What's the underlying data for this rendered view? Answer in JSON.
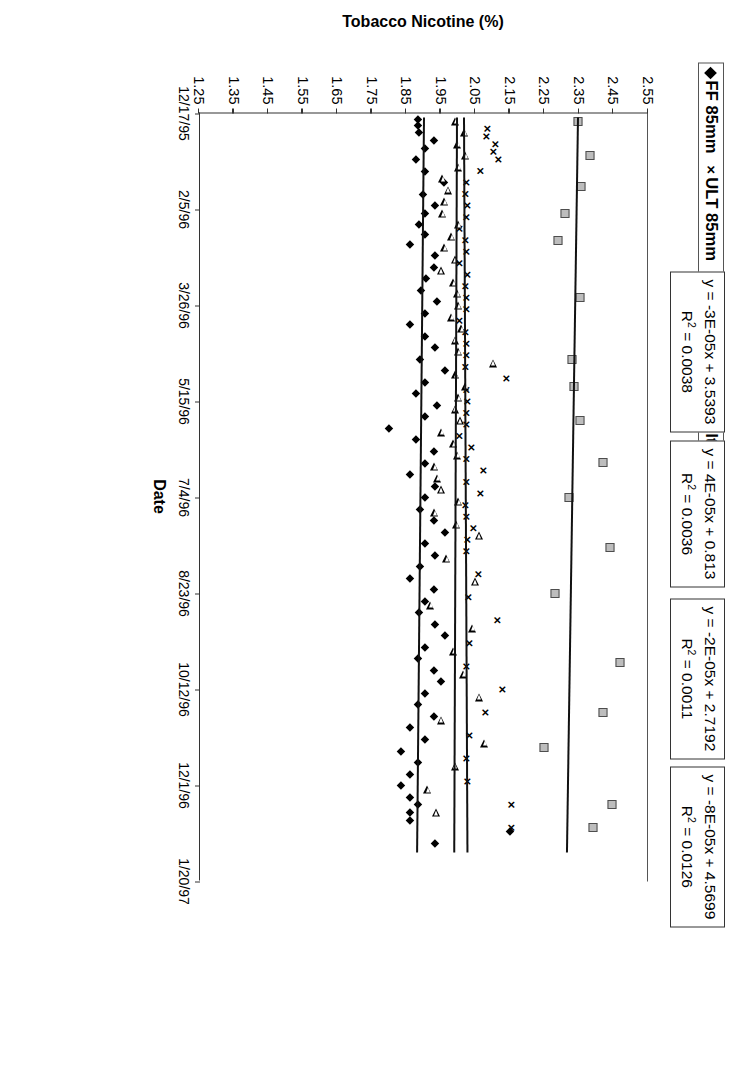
{
  "legend": {
    "items": [
      {
        "glyph": "diamond-marker",
        "label": "FF 85mm"
      },
      {
        "glyph": "x-marker",
        "label": "ULT 85mm"
      },
      {
        "glyph": "triangle-marker",
        "label": "LT 85mm"
      },
      {
        "glyph": "square-marker",
        "label": "Non-Filtered 70mm"
      }
    ]
  },
  "equations": [
    {
      "line1": "y = -3E-05x + 3.5393",
      "r2_label": "R",
      "r2_exp": "2",
      "r2_value": " = 0.0038"
    },
    {
      "line1": "y = 4E-05x + 0.813",
      "r2_label": "R",
      "r2_exp": "2",
      "r2_value": " = 0.0036"
    },
    {
      "line1": "y = -2E-05x + 2.7192",
      "r2_label": "R",
      "r2_exp": "2",
      "r2_value": " = 0.0011"
    },
    {
      "line1": "y = -8E-05x + 4.5699",
      "r2_label": "R",
      "r2_exp": "2",
      "r2_value": " = 0.0126"
    }
  ],
  "chart_data": {
    "type": "scatter",
    "title": "",
    "xlabel": "Date",
    "ylabel": "Tobacco Nicotine (%)",
    "ylim": [
      1.25,
      2.55
    ],
    "yticks": [
      "2.55",
      "2.45",
      "2.35",
      "2.25",
      "2.15",
      "2.05",
      "1.95",
      "1.85",
      "1.75",
      "1.65",
      "1.55",
      "1.45",
      "1.35",
      "1.25"
    ],
    "xticks": [
      "12/17/95",
      "2/5/96",
      "3/26/96",
      "5/15/96",
      "7/4/96",
      "8/23/96",
      "10/12/96",
      "12/1/96",
      "1/20/97"
    ],
    "xlim_days": [
      0,
      400
    ],
    "grid": false,
    "legend_position": "top-left-outside",
    "series": [
      {
        "name": "FF 85mm",
        "marker": "diamond",
        "color": "#000000",
        "trendline": {
          "equation": "y = -2E-05x + 2.7192",
          "r2": 0.0011,
          "y_start": 1.905,
          "y_end": 1.885
        },
        "points": [
          [
            3,
            1.885
          ],
          [
            6,
            1.885
          ],
          [
            10,
            1.888
          ],
          [
            14,
            1.93
          ],
          [
            18,
            1.905
          ],
          [
            24,
            1.88
          ],
          [
            30,
            1.905
          ],
          [
            36,
            1.96
          ],
          [
            42,
            1.9
          ],
          [
            48,
            1.935
          ],
          [
            52,
            1.905
          ],
          [
            58,
            1.888
          ],
          [
            63,
            1.905
          ],
          [
            68,
            1.862
          ],
          [
            74,
            1.935
          ],
          [
            80,
            1.93
          ],
          [
            86,
            1.908
          ],
          [
            92,
            1.892
          ],
          [
            98,
            1.938
          ],
          [
            104,
            1.905
          ],
          [
            110,
            1.862
          ],
          [
            116,
            1.905
          ],
          [
            122,
            1.935
          ],
          [
            128,
            1.89
          ],
          [
            134,
            1.962
          ],
          [
            140,
            1.905
          ],
          [
            146,
            1.88
          ],
          [
            152,
            1.938
          ],
          [
            158,
            1.905
          ],
          [
            164,
            1.8
          ],
          [
            170,
            1.88
          ],
          [
            176,
            1.93
          ],
          [
            182,
            1.905
          ],
          [
            188,
            1.862
          ],
          [
            194,
            1.935
          ],
          [
            200,
            1.905
          ],
          [
            206,
            1.89
          ],
          [
            212,
            1.93
          ],
          [
            218,
            1.962
          ],
          [
            224,
            1.905
          ],
          [
            230,
            1.935
          ],
          [
            236,
            1.89
          ],
          [
            242,
            1.862
          ],
          [
            248,
            1.93
          ],
          [
            254,
            1.905
          ],
          [
            260,
            1.888
          ],
          [
            266,
            1.935
          ],
          [
            272,
            1.962
          ],
          [
            278,
            1.905
          ],
          [
            284,
            1.885
          ],
          [
            290,
            1.93
          ],
          [
            296,
            1.95
          ],
          [
            302,
            1.905
          ],
          [
            308,
            1.885
          ],
          [
            314,
            1.93
          ],
          [
            320,
            1.862
          ],
          [
            326,
            1.905
          ],
          [
            332,
            1.835
          ],
          [
            338,
            1.885
          ],
          [
            344,
            1.862
          ],
          [
            350,
            1.835
          ],
          [
            356,
            1.862
          ],
          [
            360,
            1.885
          ],
          [
            364,
            1.862
          ],
          [
            368,
            1.86
          ],
          [
            374,
            2.15
          ],
          [
            380,
            1.935
          ]
        ]
      },
      {
        "name": "ULT 85mm",
        "marker": "x",
        "color": "#000000",
        "trendline": {
          "equation": "y = 4E-05x + 0.813",
          "r2": 0.0036,
          "y_start": 2.02,
          "y_end": 2.03
        },
        "points": [
          [
            8,
            2.08
          ],
          [
            12,
            2.078
          ],
          [
            16,
            2.105
          ],
          [
            20,
            2.098
          ],
          [
            24,
            2.112
          ],
          [
            30,
            2.06
          ],
          [
            36,
            2.02
          ],
          [
            42,
            2.018
          ],
          [
            48,
            2.022
          ],
          [
            54,
            2.02
          ],
          [
            60,
            2.0
          ],
          [
            66,
            2.018
          ],
          [
            72,
            2.02
          ],
          [
            78,
            2.0
          ],
          [
            84,
            2.022
          ],
          [
            90,
            2.018
          ],
          [
            96,
            2.02
          ],
          [
            102,
            2.02
          ],
          [
            108,
            2.0
          ],
          [
            114,
            2.018
          ],
          [
            120,
            2.02
          ],
          [
            126,
            2.02
          ],
          [
            132,
            2.018
          ],
          [
            138,
            2.135
          ],
          [
            144,
            2.02
          ],
          [
            150,
            2.022
          ],
          [
            156,
            2.02
          ],
          [
            162,
            2.02
          ],
          [
            168,
            2.0
          ],
          [
            174,
            2.035
          ],
          [
            180,
            2.02
          ],
          [
            186,
            2.07
          ],
          [
            192,
            2.02
          ],
          [
            198,
            2.06
          ],
          [
            204,
            2.018
          ],
          [
            210,
            2.02
          ],
          [
            216,
            2.04
          ],
          [
            222,
            2.022
          ],
          [
            228,
            2.02
          ],
          [
            240,
            2.055
          ],
          [
            252,
            2.025
          ],
          [
            264,
            2.11
          ],
          [
            276,
            2.03
          ],
          [
            288,
            2.02
          ],
          [
            300,
            2.125
          ],
          [
            312,
            2.075
          ],
          [
            324,
            2.03
          ],
          [
            336,
            2.02
          ],
          [
            348,
            2.022
          ],
          [
            360,
            2.15
          ],
          [
            372,
            2.15
          ]
        ]
      },
      {
        "name": "LT 85mm",
        "marker": "triangle",
        "color": "#000000",
        "trendline": {
          "equation": "y = -2E-05x + 2.7192",
          "r2": 0.0011,
          "y_start": 2.0,
          "y_end": 1.992
        },
        "points": [
          [
            4,
            1.992
          ],
          [
            10,
            2.018
          ],
          [
            16,
            1.998
          ],
          [
            22,
            2.02
          ],
          [
            28,
            2.0
          ],
          [
            34,
            1.955
          ],
          [
            40,
            1.97
          ],
          [
            46,
            1.96
          ],
          [
            52,
            1.955
          ],
          [
            58,
            2.0
          ],
          [
            64,
            1.98
          ],
          [
            70,
            1.96
          ],
          [
            76,
            1.99
          ],
          [
            82,
            1.95
          ],
          [
            88,
            1.985
          ],
          [
            94,
            1.998
          ],
          [
            100,
            2.0
          ],
          [
            106,
            1.98
          ],
          [
            112,
            2.01
          ],
          [
            118,
            1.99
          ],
          [
            124,
            2.0
          ],
          [
            130,
            2.1
          ],
          [
            136,
            1.992
          ],
          [
            142,
            2.02
          ],
          [
            148,
            2.0
          ],
          [
            154,
            1.99
          ],
          [
            160,
            2.005
          ],
          [
            166,
            1.952
          ],
          [
            172,
            1.985
          ],
          [
            178,
            1.998
          ],
          [
            184,
            1.93
          ],
          [
            190,
            1.94
          ],
          [
            196,
            1.95
          ],
          [
            202,
            2.0
          ],
          [
            208,
            1.93
          ],
          [
            214,
            1.995
          ],
          [
            220,
            2.06
          ],
          [
            232,
            1.965
          ],
          [
            244,
            2.048
          ],
          [
            256,
            1.92
          ],
          [
            268,
            2.04
          ],
          [
            280,
            1.985
          ],
          [
            292,
            2.015
          ],
          [
            304,
            2.06
          ],
          [
            316,
            1.95
          ],
          [
            328,
            2.075
          ],
          [
            340,
            1.99
          ],
          [
            352,
            1.91
          ],
          [
            364,
            1.935
          ]
        ]
      },
      {
        "name": "Non-Filtered 70mm",
        "marker": "square",
        "color": "#bdbdbd",
        "trendline": {
          "equation": "y = -8E-05x + 4.5699",
          "r2": 0.0126,
          "y_start": 2.35,
          "y_end": 2.318
        },
        "points": [
          [
            4,
            2.348
          ],
          [
            22,
            2.382
          ],
          [
            38,
            2.355
          ],
          [
            52,
            2.31
          ],
          [
            66,
            2.29
          ],
          [
            96,
            2.352
          ],
          [
            128,
            2.33
          ],
          [
            142,
            2.335
          ],
          [
            160,
            2.352
          ],
          [
            182,
            2.42
          ],
          [
            200,
            2.322
          ],
          [
            226,
            2.44
          ],
          [
            250,
            2.282
          ],
          [
            286,
            2.47
          ],
          [
            312,
            2.42
          ],
          [
            330,
            2.25
          ],
          [
            360,
            2.445
          ],
          [
            372,
            2.39
          ]
        ]
      }
    ]
  }
}
